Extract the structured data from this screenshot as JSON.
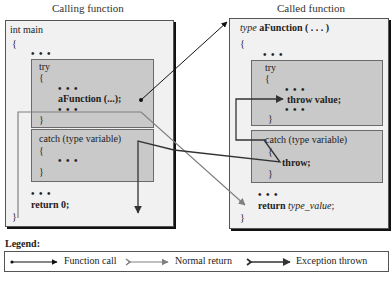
{
  "titles": {
    "calling": "Calling function",
    "called": "Called function"
  },
  "calling": {
    "header": "int main",
    "open_brace": "{",
    "dots1": "• • •",
    "try_label": "try",
    "try_open": "{",
    "try_dots1": "• • •",
    "call_stmt": "aFunction (...);",
    "try_dots2": "• • •",
    "try_close": "}",
    "catch_label": "catch (type variable)",
    "catch_open": "{",
    "catch_dots": "• • •",
    "catch_close": "}",
    "dots2": "• • •",
    "return_stmt": "return 0;",
    "close_brace": "}"
  },
  "called": {
    "header_type": "type",
    "header_name": "aFunction ( . . . )",
    "open_brace": "{",
    "dots1": "• • •",
    "try_label": "try",
    "try_open": "{",
    "try_dots1": "• • •",
    "throw_stmt": "throw value;",
    "try_dots2": "• • •",
    "try_close": "}",
    "catch_label": "catch (type variable)",
    "catch_open": "{",
    "rethrow_stmt": "throw;",
    "catch_close": "}",
    "dots2": "• • •",
    "return_kw": "return",
    "return_val": "type_value",
    "return_semi": ";",
    "close_brace": "}"
  },
  "legend": {
    "title": "Legend:",
    "items": [
      {
        "label": "Function call",
        "style": "black-dot-arrow"
      },
      {
        "label": "Normal return",
        "style": "gray-feathered-arrow"
      },
      {
        "label": "Exception thrown",
        "style": "black-feathered-arrow"
      }
    ]
  },
  "colors": {
    "call_arrow": "#111111",
    "return_arrow": "#808080",
    "exception_arrow": "#333333",
    "block_fill": "#c9c9c9",
    "panel_fill": "#f1f1f1"
  }
}
